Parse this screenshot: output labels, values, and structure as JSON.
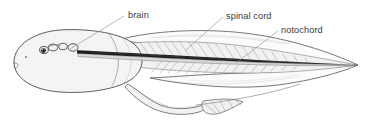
{
  "figure": {
    "title": "Tadpole (amphibian larva) lateral view",
    "background_color": "#ffffff",
    "ink_color": "#555555",
    "label_color": "#3a3a3a",
    "leader_color": "#8c8c8c"
  },
  "labels": [
    {
      "id": "brain",
      "text": "brain",
      "text_x": 128,
      "text_y": 18,
      "leader": "M124,16 L70,49",
      "anchor_x": 70,
      "anchor_y": 49
    },
    {
      "id": "spinal-cord",
      "text": "spinal cord",
      "text_x": 226,
      "text_y": 19,
      "leader": "M223,17 L186,50",
      "anchor_x": 186,
      "anchor_y": 50
    },
    {
      "id": "notochord",
      "text": "notochord",
      "text_x": 281,
      "text_y": 33,
      "leader": "M278,31 L236,63",
      "anchor_x": 236,
      "anchor_y": 63
    }
  ],
  "structures": {
    "head": "rounded ovoid head and trunk, left end of animal",
    "eye": "dark pigmented eye with lens, upper left of head",
    "nostril": "small dot anterior to eye",
    "mouth": "small notch at anterior ventral margin",
    "brain_vesicles": "chain of three swellings behind the eye",
    "spinal_cord": "dark longitudinal rod running from brain to tail tip",
    "notochord": "pale rod immediately ventral to the spinal cord",
    "myotomes": "chevron muscle blocks arranged dorsal and ventral to the axis",
    "dorsal_fin": "translucent fin above the tail",
    "ventral_fin": "translucent fin below the tail",
    "tail_tip": "tail tapering to a point at the right",
    "hind_limb": "hind leg with webbed foot projecting ventrally"
  },
  "counts": {
    "brain_vesicles": 3,
    "dorsal_myotomes": 17,
    "ventral_myotomes": 15,
    "toes": 5
  }
}
